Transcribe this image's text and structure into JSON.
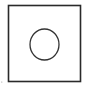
{
  "diagram": {
    "shapes": [
      {
        "type": "square",
        "x": 8.5,
        "y": 5.5,
        "width": 72,
        "height": 76,
        "stroke": "#2a2a2a",
        "stroke_width": 1.6,
        "fill": "none"
      },
      {
        "type": "circle",
        "cx": 44.5,
        "cy": 44.5,
        "rx": 14.5,
        "ry": 15.5,
        "stroke": "#333333",
        "stroke_width": 1.3,
        "fill": "none"
      },
      {
        "type": "dot",
        "cx": 1.8,
        "cy": 82,
        "r": 0.6,
        "fill": "#9a9a9a"
      }
    ],
    "background": "#ffffff"
  }
}
